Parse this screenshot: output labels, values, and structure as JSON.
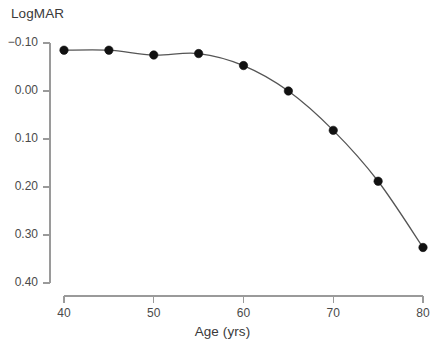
{
  "chart_data": {
    "type": "line",
    "title": "",
    "subtitle": "",
    "xlabel": "Age (yrs)",
    "ylabel": "LogMAR",
    "x": [
      40,
      45,
      50,
      55,
      60,
      65,
      70,
      75,
      80
    ],
    "values": [
      -0.085,
      -0.085,
      -0.075,
      -0.078,
      -0.053,
      0.0,
      0.082,
      0.188,
      0.326
    ],
    "series": [
      {
        "name": "LogMAR visual acuity",
        "x": [
          40,
          45,
          50,
          55,
          60,
          65,
          70,
          75,
          80
        ],
        "values": [
          -0.085,
          -0.085,
          -0.075,
          -0.078,
          -0.053,
          0.0,
          0.082,
          0.188,
          0.326
        ]
      }
    ],
    "xlim": [
      40,
      80
    ],
    "ylim": [
      -0.1,
      0.4
    ],
    "y_axis_inverted": true,
    "xticks": [
      40,
      50,
      60,
      70,
      80
    ],
    "xtick_labels": [
      "40",
      "50",
      "60",
      "70",
      "80"
    ],
    "yticks": [
      -0.1,
      0.0,
      0.1,
      0.2,
      0.3,
      0.4
    ],
    "ytick_labels": [
      "−0.10",
      "0.00",
      "0.10",
      "0.20",
      "0.30",
      "0.40"
    ],
    "grid": false,
    "legend": null,
    "legend_position": "none",
    "marker": "filled-circle",
    "marker_color": "#111111",
    "line_color": "#555555",
    "axis_color": "#9a9a9a",
    "background_color": "#ffffff",
    "annotations": []
  },
  "axes": {
    "y_title": "LogMAR",
    "x_title": "Age (yrs)"
  }
}
